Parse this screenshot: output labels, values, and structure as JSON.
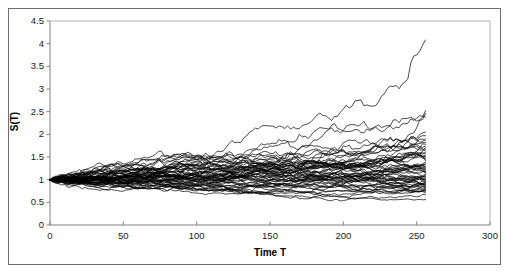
{
  "chart_data": {
    "type": "line",
    "title": "",
    "xlabel": "Time T",
    "ylabel": "S(T)",
    "xlim": [
      0,
      300
    ],
    "ylim": [
      0,
      4.5
    ],
    "xticks": [
      0,
      50,
      100,
      150,
      200,
      250,
      300
    ],
    "xtick_labels": [
      "0",
      "50",
      "100",
      "150",
      "200",
      "250",
      "300"
    ],
    "yticks": [
      0,
      0.5,
      1,
      1.5,
      2,
      2.5,
      3,
      3.5,
      4,
      4.5
    ],
    "ytick_labels": [
      "0",
      "0.5",
      "1",
      "1.5",
      "2",
      "2.5",
      "3",
      "3.5",
      "4",
      "4.5"
    ],
    "grid": false,
    "legend": false,
    "line_color": "#000000",
    "line_width": 0.7,
    "n_series": 60,
    "x_start": 0,
    "x_end": 256,
    "y_start": 1.0,
    "series_endpoints": [
      4.08,
      2.52,
      2.46,
      2.38,
      2.05,
      1.97,
      1.9,
      1.86,
      1.82,
      1.78,
      1.74,
      1.7,
      1.67,
      1.63,
      1.6,
      1.57,
      1.54,
      1.51,
      1.48,
      1.45,
      1.42,
      1.39,
      1.36,
      1.33,
      1.3,
      1.28,
      1.26,
      1.24,
      1.22,
      1.2,
      1.18,
      1.16,
      1.14,
      1.12,
      1.1,
      1.08,
      1.06,
      1.04,
      1.02,
      1.0,
      0.99,
      0.97,
      0.96,
      0.94,
      0.93,
      0.91,
      0.9,
      0.88,
      0.87,
      0.85,
      0.84,
      0.82,
      0.81,
      0.79,
      0.78,
      0.76,
      0.74,
      0.71,
      0.67,
      0.56
    ],
    "series_drifts": [
      0.0055,
      0.0037,
      0.0036,
      0.0034,
      0.0029,
      0.0027,
      0.0026,
      0.0025,
      0.0024,
      0.0023,
      0.0022,
      0.0021,
      0.002,
      0.0019,
      0.0018,
      0.0017,
      0.0017,
      0.0016,
      0.0015,
      0.0014,
      0.0014,
      0.0013,
      0.0012,
      0.0011,
      0.001,
      0.001,
      0.0009,
      0.0008,
      0.0008,
      0.0007,
      0.0007,
      0.0006,
      0.0005,
      0.0005,
      0.0004,
      0.0003,
      0.0003,
      0.0002,
      0.0001,
      0.0,
      -0.0,
      -0.0001,
      -0.0002,
      -0.0002,
      -0.0003,
      -0.0004,
      -0.0004,
      -0.0005,
      -0.0006,
      -0.0006,
      -0.0007,
      -0.0008,
      -0.0008,
      -0.0009,
      -0.001,
      -0.0011,
      -0.0012,
      -0.0013,
      -0.0015,
      -0.0023
    ],
    "volatility": 0.026
  },
  "plot_area": {
    "left": 50,
    "top": 21,
    "right": 490,
    "bottom": 225
  }
}
